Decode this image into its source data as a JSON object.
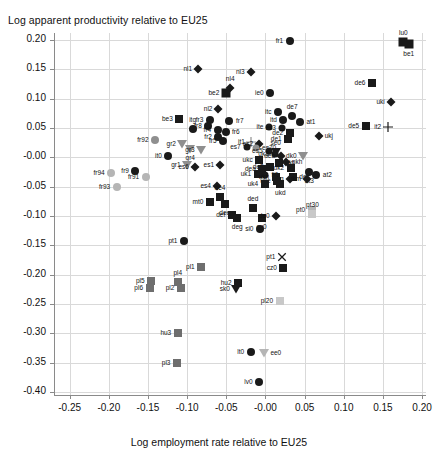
{
  "chart_data": {
    "type": "scatter",
    "title": "Log apparent productivity relative to EU25",
    "xlabel": "Log employment rate relative to EU25",
    "ylabel": "Log apparent productivity relative to EU25",
    "xlim": [
      -0.27,
      0.205
    ],
    "ylim": [
      -0.405,
      0.212
    ],
    "xticks": [
      -0.25,
      -0.2,
      -0.15,
      -0.1,
      -0.05,
      -0.0,
      0.05,
      0.1,
      0.15,
      0.2
    ],
    "xticklabels": [
      "-0.25",
      "-0.20",
      "-0.15",
      "-0.10",
      "-0.05",
      "-0.00",
      "0.05",
      "0.10",
      "0.15",
      "0.20"
    ],
    "yticks": [
      0.2,
      0.15,
      0.1,
      0.05,
      -0.0,
      -0.05,
      -0.1,
      -0.15,
      -0.2,
      -0.25,
      -0.3,
      -0.35,
      -0.4
    ],
    "yticklabels": [
      "0.20",
      "0.15",
      "0.10",
      "0.05",
      "-0.00",
      "-0.05",
      "-0.10",
      "-0.15",
      "-0.20",
      "-0.25",
      "-0.30",
      "-0.35",
      "-0.40"
    ],
    "grid": true,
    "legend": "none",
    "marker_shapes": [
      "circle",
      "square",
      "diamond",
      "triangle",
      "plus",
      "cross"
    ],
    "colors": {
      "black": "#1a1a1a",
      "gray": "#8f8f8f",
      "light_gray": "#c8c8c8",
      "grid": "#d9d9d9",
      "axis": "#8a8a8a"
    },
    "points": [
      {
        "label": "fr1",
        "x": 0.031,
        "y": 0.199,
        "shape": "circle",
        "color": "#1a1a1a",
        "size": 8,
        "lpos": "l"
      },
      {
        "label": "lu0",
        "x": 0.176,
        "y": 0.196,
        "shape": "square",
        "color": "#1a1a1a",
        "size": 9,
        "lpos": "t"
      },
      {
        "label": "be1",
        "x": 0.183,
        "y": 0.193,
        "shape": "square",
        "color": "#1a1a1a",
        "size": 9,
        "lpos": "b"
      },
      {
        "label": "nl1",
        "x": -0.086,
        "y": 0.151,
        "shape": "diamond",
        "color": "#1a1a1a",
        "size": 7,
        "lpos": "l"
      },
      {
        "label": "nl3",
        "x": -0.019,
        "y": 0.146,
        "shape": "diamond",
        "color": "#1a1a1a",
        "size": 7,
        "lpos": "l"
      },
      {
        "label": "de6",
        "x": 0.136,
        "y": 0.126,
        "shape": "square",
        "color": "#1a1a1a",
        "size": 8,
        "lpos": "l"
      },
      {
        "label": "nl4",
        "x": -0.045,
        "y": 0.119,
        "shape": "diamond",
        "color": "#1a1a1a",
        "size": 7,
        "lpos": "t"
      },
      {
        "label": "be2",
        "x": -0.05,
        "y": 0.11,
        "shape": "square",
        "color": "#1a1a1a",
        "size": 9,
        "lpos": "l"
      },
      {
        "label": "ie0",
        "x": 0.006,
        "y": 0.109,
        "shape": "circle",
        "color": "#1a1a1a",
        "size": 8,
        "lpos": "l"
      },
      {
        "label": "uki",
        "x": 0.16,
        "y": 0.094,
        "shape": "diamond",
        "color": "#1a1a1a",
        "size": 7,
        "lpos": "l"
      },
      {
        "label": "nl2",
        "x": -0.06,
        "y": 0.082,
        "shape": "diamond",
        "color": "#1a1a1a",
        "size": 7,
        "lpos": "l"
      },
      {
        "label": "itc",
        "x": 0.016,
        "y": 0.078,
        "shape": "circle",
        "color": "#1a1a1a",
        "size": 8,
        "lpos": "l"
      },
      {
        "label": "de7",
        "x": 0.034,
        "y": 0.07,
        "shape": "circle",
        "color": "#1a1a1a",
        "size": 8,
        "lpos": "t"
      },
      {
        "label": "be3",
        "x": -0.11,
        "y": 0.066,
        "shape": "square",
        "color": "#1a1a1a",
        "size": 8,
        "lpos": "l"
      },
      {
        "label": "fr3",
        "x": -0.071,
        "y": 0.064,
        "shape": "circle",
        "color": "#1a1a1a",
        "size": 8,
        "lpos": "l"
      },
      {
        "label": "itd",
        "x": 0.023,
        "y": 0.064,
        "shape": "circle",
        "color": "#1a1a1a",
        "size": 8,
        "lpos": "l"
      },
      {
        "label": "fr7",
        "x": -0.046,
        "y": 0.062,
        "shape": "circle",
        "color": "#1a1a1a",
        "size": 8,
        "lpos": "r"
      },
      {
        "label": "at1",
        "x": 0.044,
        "y": 0.061,
        "shape": "circle",
        "color": "#1a1a1a",
        "size": 8,
        "lpos": "r"
      },
      {
        "label": "de5",
        "x": 0.128,
        "y": 0.053,
        "shape": "square",
        "color": "#1a1a1a",
        "size": 8,
        "lpos": "l"
      },
      {
        "label": "it2",
        "x": 0.156,
        "y": 0.052,
        "shape": "plus",
        "color": "#1a1a1a",
        "size": 8,
        "lpos": "l"
      },
      {
        "label": "fr8",
        "x": -0.073,
        "y": 0.054,
        "shape": "circle",
        "color": "#1a1a1a",
        "size": 8,
        "lpos": "l"
      },
      {
        "label": "ite",
        "x": 0.005,
        "y": 0.052,
        "shape": "circle",
        "color": "#1a1a1a",
        "size": 7,
        "lpos": "l"
      },
      {
        "label": "es3",
        "x": 0.021,
        "y": 0.05,
        "shape": "circle",
        "color": "#1a1a1a",
        "size": 7,
        "lpos": "l"
      },
      {
        "label": "itg",
        "x": -0.093,
        "y": 0.048,
        "shape": "circle",
        "color": "#1a1a1a",
        "size": 8,
        "lpos": "t"
      },
      {
        "label": "fr4",
        "x": -0.061,
        "y": 0.046,
        "shape": "circle",
        "color": "#1a1a1a",
        "size": 8,
        "lpos": "l"
      },
      {
        "label": "fr6",
        "x": -0.051,
        "y": 0.044,
        "shape": "circle",
        "color": "#1a1a1a",
        "size": 8,
        "lpos": "r"
      },
      {
        "label": "de2",
        "x": 0.031,
        "y": 0.041,
        "shape": "square",
        "color": "#1a1a1a",
        "size": 8,
        "lpos": "l"
      },
      {
        "label": "ukj",
        "x": 0.068,
        "y": 0.036,
        "shape": "diamond",
        "color": "#1a1a1a",
        "size": 7,
        "lpos": "r"
      },
      {
        "label": "fr2",
        "x": -0.06,
        "y": 0.034,
        "shape": "circle",
        "color": "#1a1a1a",
        "size": 8,
        "lpos": "l"
      },
      {
        "label": "de1",
        "x": 0.029,
        "y": 0.031,
        "shape": "square",
        "color": "#1a1a1a",
        "size": 8,
        "lpos": "l"
      },
      {
        "label": "fr92",
        "x": -0.141,
        "y": 0.03,
        "shape": "circle",
        "color": "#8f8f8f",
        "size": 8,
        "lpos": "l"
      },
      {
        "label": "fr5",
        "x": -0.054,
        "y": 0.028,
        "shape": "circle",
        "color": "#1a1a1a",
        "size": 8,
        "lpos": "l"
      },
      {
        "label": "it1",
        "x": -0.018,
        "y": 0.026,
        "shape": "plus",
        "color": "#8f8f8f",
        "size": 8,
        "lpos": "l"
      },
      {
        "label": "es2",
        "x": -0.008,
        "y": 0.023,
        "shape": "diamond",
        "color": "#1a1a1a",
        "size": 7,
        "lpos": "l"
      },
      {
        "label": "gr2",
        "x": -0.106,
        "y": 0.022,
        "shape": "triangle",
        "color": "#8f8f8f",
        "size": 8,
        "lpos": "l"
      },
      {
        "label": "es7",
        "x": -0.024,
        "y": 0.018,
        "shape": "circle",
        "color": "#1a1a1a",
        "size": 7,
        "lpos": "l"
      },
      {
        "label": "es70",
        "x": -0.012,
        "y": 0.016,
        "shape": "circle",
        "color": "#8f8f8f",
        "size": 7,
        "lpos": "r"
      },
      {
        "label": "gr4",
        "x": -0.096,
        "y": 0.014,
        "shape": "triangle",
        "color": "#8f8f8f",
        "size": 8,
        "lpos": "b"
      },
      {
        "label": "gr3",
        "x": -0.082,
        "y": 0.012,
        "shape": "triangle",
        "color": "#8f8f8f",
        "size": 8,
        "lpos": "l"
      },
      {
        "label": "es5",
        "x": 0.004,
        "y": 0.011,
        "shape": "circle",
        "color": "#1a1a1a",
        "size": 7,
        "lpos": "l"
      },
      {
        "label": "se0",
        "x": 0.013,
        "y": 0.01,
        "shape": "triangle",
        "color": "#1a1a1a",
        "size": 8,
        "lpos": "t"
      },
      {
        "label": "uk3",
        "x": 0.012,
        "y": 0.005,
        "shape": "circle",
        "color": "#1a1a1a",
        "size": 7,
        "lpos": "l"
      },
      {
        "label": "dk0",
        "x": 0.048,
        "y": 0.003,
        "shape": "triangle",
        "color": "#8f8f8f",
        "size": 8,
        "lpos": "l"
      },
      {
        "label": "it0",
        "x": -0.124,
        "y": 0.002,
        "shape": "circle",
        "color": "#1a1a1a",
        "size": 8,
        "lpos": "l"
      },
      {
        "label": "deb",
        "x": 0.02,
        "y": 0.002,
        "shape": "diamond",
        "color": "#1a1a1a",
        "size": 7,
        "lpos": "l"
      },
      {
        "label": "ukc",
        "x": -0.008,
        "y": -0.005,
        "shape": "square",
        "color": "#1a1a1a",
        "size": 8,
        "lpos": "l"
      },
      {
        "label": "ukh",
        "x": 0.026,
        "y": -0.008,
        "shape": "diamond",
        "color": "#1a1a1a",
        "size": 7,
        "lpos": "r"
      },
      {
        "label": "ukf",
        "x": 0.017,
        "y": -0.01,
        "shape": "square",
        "color": "#1a1a1a",
        "size": 8,
        "lpos": "r"
      },
      {
        "label": "gr1",
        "x": -0.1,
        "y": -0.013,
        "shape": "triangle",
        "color": "#8f8f8f",
        "size": 8,
        "lpos": "l"
      },
      {
        "label": "es6",
        "x": -0.09,
        "y": -0.016,
        "shape": "diamond",
        "color": "#1a1a1a",
        "size": 7,
        "lpos": "l"
      },
      {
        "label": "es1",
        "x": -0.058,
        "y": -0.013,
        "shape": "diamond",
        "color": "#1a1a1a",
        "size": 7,
        "lpos": "l"
      },
      {
        "label": "de3",
        "x": 0.006,
        "y": -0.016,
        "shape": "square",
        "color": "#1a1a1a",
        "size": 8,
        "lpos": "l"
      },
      {
        "label": "uk2",
        "x": 0.032,
        "y": -0.018,
        "shape": "square",
        "color": "#1a1a1a",
        "size": 8,
        "lpos": "l"
      },
      {
        "label": "dea",
        "x": -0.004,
        "y": -0.019,
        "shape": "square",
        "color": "#1a1a1a",
        "size": 8,
        "lpos": "l"
      },
      {
        "label": "at2",
        "x": 0.065,
        "y": -0.03,
        "shape": "circle",
        "color": "#1a1a1a",
        "size": 8,
        "lpos": "r"
      },
      {
        "label": "at3",
        "x": 0.056,
        "y": -0.025,
        "shape": "circle",
        "color": "#1a1a1a",
        "size": 8,
        "lpos": "b"
      },
      {
        "label": "uk1",
        "x": -0.01,
        "y": -0.029,
        "shape": "square",
        "color": "#1a1a1a",
        "size": 8,
        "lpos": "l"
      },
      {
        "label": "fi0",
        "x": 0.0,
        "y": -0.03,
        "shape": "circle",
        "color": "#1a1a1a",
        "size": 7,
        "lpos": "r"
      },
      {
        "label": "ukn",
        "x": 0.013,
        "y": -0.034,
        "shape": "square",
        "color": "#1a1a1a",
        "size": 8,
        "lpos": "l"
      },
      {
        "label": "dec",
        "x": 0.035,
        "y": -0.034,
        "shape": "square",
        "color": "#1a1a1a",
        "size": 8,
        "lpos": "r"
      },
      {
        "label": "ukg",
        "x": 0.031,
        "y": -0.036,
        "shape": "diamond",
        "color": "#1a1a1a",
        "size": 7,
        "lpos": "l"
      },
      {
        "label": "ukm",
        "x": 0.053,
        "y": -0.037,
        "shape": "diamond",
        "color": "#1a1a1a",
        "size": 7,
        "lpos": "l"
      },
      {
        "label": "uke",
        "x": 0.015,
        "y": -0.041,
        "shape": "square",
        "color": "#1a1a1a",
        "size": 8,
        "lpos": "l"
      },
      {
        "label": "ukd",
        "x": 0.019,
        "y": -0.046,
        "shape": "square",
        "color": "#1a1a1a",
        "size": 8,
        "lpos": "b"
      },
      {
        "label": "uk4",
        "x": -0.001,
        "y": -0.046,
        "shape": "square",
        "color": "#1a1a1a",
        "size": 8,
        "lpos": "l"
      },
      {
        "label": "es4",
        "x": -0.062,
        "y": -0.049,
        "shape": "diamond",
        "color": "#1a1a1a",
        "size": 7,
        "lpos": "l"
      },
      {
        "label": "fr94",
        "x": -0.197,
        "y": -0.026,
        "shape": "circle",
        "color": "#b5b5b5",
        "size": 8,
        "lpos": "l"
      },
      {
        "label": "fr9",
        "x": -0.166,
        "y": -0.024,
        "shape": "circle",
        "color": "#1a1a1a",
        "size": 8,
        "lpos": "l"
      },
      {
        "label": "fr91",
        "x": -0.153,
        "y": -0.033,
        "shape": "circle",
        "color": "#b5b5b5",
        "size": 8,
        "lpos": "l"
      },
      {
        "label": "fr93",
        "x": -0.19,
        "y": -0.05,
        "shape": "circle",
        "color": "#b5b5b5",
        "size": 8,
        "lpos": "l"
      },
      {
        "label": "de4",
        "x": -0.058,
        "y": -0.068,
        "shape": "square",
        "color": "#1a1a1a",
        "size": 8,
        "lpos": "t"
      },
      {
        "label": "mt0",
        "x": -0.071,
        "y": -0.076,
        "shape": "square",
        "color": "#1a1a1a",
        "size": 8,
        "lpos": "l"
      },
      {
        "label": "dee",
        "x": -0.052,
        "y": -0.079,
        "shape": "square",
        "color": "#1a1a1a",
        "size": 8,
        "lpos": "b"
      },
      {
        "label": "ded",
        "x": -0.016,
        "y": -0.086,
        "shape": "square",
        "color": "#1a1a1a",
        "size": 8,
        "lpos": "t"
      },
      {
        "label": "pt0",
        "x": 0.059,
        "y": -0.089,
        "shape": "square",
        "color": "#b5b5b5",
        "size": 8,
        "lpos": "l"
      },
      {
        "label": "pt30",
        "x": 0.06,
        "y": -0.096,
        "shape": "square",
        "color": "#c8c8c8",
        "size": 8,
        "lpos": "t"
      },
      {
        "label": "def",
        "x": -0.043,
        "y": -0.098,
        "shape": "square",
        "color": "#1a1a1a",
        "size": 8,
        "lpos": "l"
      },
      {
        "label": "deg",
        "x": -0.036,
        "y": -0.104,
        "shape": "square",
        "color": "#1a1a1a",
        "size": 8,
        "lpos": "b"
      },
      {
        "label": "cy0",
        "x": -0.005,
        "y": -0.103,
        "shape": "square",
        "color": "#1a1a1a",
        "size": 8,
        "lpos": "b"
      },
      {
        "label": "de0",
        "x": 0.013,
        "y": -0.1,
        "shape": "diamond",
        "color": "#1a1a1a",
        "size": 7,
        "lpos": "l"
      },
      {
        "label": "si0",
        "x": -0.007,
        "y": -0.122,
        "shape": "circle",
        "color": "#1a1a1a",
        "size": 8,
        "lpos": "l"
      },
      {
        "label": "pt1",
        "x": -0.104,
        "y": -0.142,
        "shape": "circle",
        "color": "#1a1a1a",
        "size": 8,
        "lpos": "l"
      },
      {
        "label": "pt1x",
        "x": 0.021,
        "y": -0.169,
        "shape": "cross",
        "color": "#1a1a1a",
        "size": 8,
        "lpos": "l"
      },
      {
        "label": "cz0",
        "x": 0.023,
        "y": -0.189,
        "shape": "square",
        "color": "#1a1a1a",
        "size": 8,
        "lpos": "l"
      },
      {
        "label": "pl1",
        "x": -0.082,
        "y": -0.186,
        "shape": "square",
        "color": "#6e6e6e",
        "size": 8,
        "lpos": "l"
      },
      {
        "label": "pl5",
        "x": -0.146,
        "y": -0.21,
        "shape": "square",
        "color": "#6e6e6e",
        "size": 8,
        "lpos": "l"
      },
      {
        "label": "pl4",
        "x": -0.112,
        "y": -0.213,
        "shape": "square",
        "color": "#6e6e6e",
        "size": 8,
        "lpos": "t"
      },
      {
        "label": "hu2",
        "x": -0.035,
        "y": -0.214,
        "shape": "square",
        "color": "#1a1a1a",
        "size": 8,
        "lpos": "l"
      },
      {
        "label": "pl6",
        "x": -0.148,
        "y": -0.222,
        "shape": "square",
        "color": "#6e6e6e",
        "size": 8,
        "lpos": "l"
      },
      {
        "label": "pl2",
        "x": -0.108,
        "y": -0.222,
        "shape": "square",
        "color": "#6e6e6e",
        "size": 8,
        "lpos": "l"
      },
      {
        "label": "sk0",
        "x": -0.037,
        "y": -0.224,
        "shape": "triangle",
        "color": "#1a1a1a",
        "size": 8,
        "lpos": "l"
      },
      {
        "label": "pl20",
        "x": 0.018,
        "y": -0.245,
        "shape": "square",
        "color": "#c8c8c8",
        "size": 8,
        "lpos": "l"
      },
      {
        "label": "hu3",
        "x": -0.112,
        "y": -0.299,
        "shape": "square",
        "color": "#6e6e6e",
        "size": 8,
        "lpos": "l"
      },
      {
        "label": "lt0",
        "x": -0.019,
        "y": -0.332,
        "shape": "circle",
        "color": "#1a1a1a",
        "size": 8,
        "lpos": "l"
      },
      {
        "label": "ee0",
        "x": -0.002,
        "y": -0.334,
        "shape": "triangle",
        "color": "#b5b5b5",
        "size": 8,
        "lpos": "r"
      },
      {
        "label": "pl3",
        "x": -0.113,
        "y": -0.351,
        "shape": "square",
        "color": "#6e6e6e",
        "size": 8,
        "lpos": "l"
      },
      {
        "label": "lv0",
        "x": -0.008,
        "y": -0.382,
        "shape": "circle",
        "color": "#1a1a1a",
        "size": 8,
        "lpos": "l"
      }
    ]
  }
}
